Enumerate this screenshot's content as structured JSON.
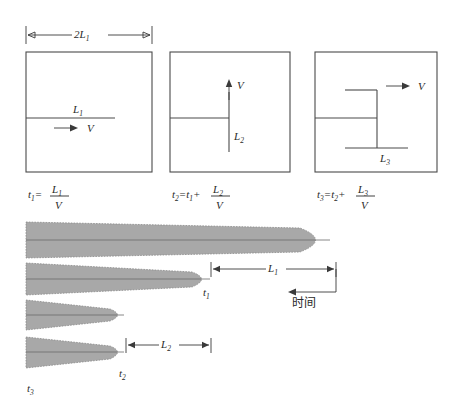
{
  "figure": {
    "title_present": false,
    "panels": [
      {
        "id": "panel-1",
        "box_label_length": "L",
        "box_label_length_sub": "1",
        "velocity_label": "V",
        "top_dimension_label": "2L",
        "top_dimension_sub": "1",
        "formula": {
          "lhs": "t",
          "lhs_sub": "1",
          "eq": "=",
          "numerator": "L",
          "numerator_sub": "1",
          "denominator": "V"
        }
      },
      {
        "id": "panel-2",
        "box_label_length": "L",
        "box_label_length_sub": "2",
        "velocity_label": "V",
        "formula": {
          "lhs": "t",
          "lhs_sub": "2",
          "eq": "=",
          "prev": "t",
          "prev_sub": "1",
          "plus": "+",
          "numerator": "L",
          "numerator_sub": "2",
          "denominator": "V"
        }
      },
      {
        "id": "panel-3",
        "box_label_length": "L",
        "box_label_length_sub": "3",
        "velocity_label": "V",
        "formula": {
          "lhs": "t",
          "lhs_sub": "3",
          "eq": "=",
          "prev": "t",
          "prev_sub": "2",
          "plus": "+",
          "numerator": "L",
          "numerator_sub": "3",
          "denominator": "V"
        }
      }
    ],
    "lower_diagram": {
      "shapes": [
        {
          "id": "leaf-1",
          "tip_label": "",
          "tip_label_sub": ""
        },
        {
          "id": "leaf-2",
          "tip_label": "t",
          "tip_label_sub": "1"
        },
        {
          "id": "leaf-3",
          "tip_label": "",
          "tip_label_sub": ""
        },
        {
          "id": "leaf-4",
          "tip_label": "t",
          "tip_label_sub": "2"
        }
      ],
      "bottom_left_label": "t",
      "bottom_left_label_sub": "3",
      "dimension_L1": "L",
      "dimension_L1_sub": "1",
      "dimension_L2": "L",
      "dimension_L2_sub": "2",
      "time_axis_label": "时间"
    },
    "colors": {
      "shape_fill": "#a8a8a8",
      "shape_stroke": "#8a8a8a",
      "line": "#4a4a4a",
      "text": "#2a2a2a",
      "background": "#ffffff"
    }
  }
}
